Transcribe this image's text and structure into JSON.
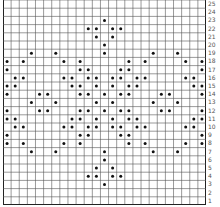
{
  "chart_data": {
    "type": "heatmap",
    "title": "",
    "columns": 25,
    "rows": 25,
    "row_labels": [
      "1",
      "2",
      "3",
      "4",
      "5",
      "6",
      "7",
      "8",
      "9",
      "10",
      "11",
      "12",
      "13",
      "14",
      "15",
      "16",
      "17",
      "18",
      "19",
      "20",
      "21",
      "22",
      "23",
      "24",
      "25"
    ],
    "row_label_position": "right",
    "marked_cells_by_row": {
      "25": [],
      "24": [],
      "23": [
        13
      ],
      "22": [
        11,
        12,
        14,
        15
      ],
      "21": [
        12,
        14
      ],
      "20": [
        13
      ],
      "19": [
        4,
        7,
        13,
        19,
        22
      ],
      "18": [
        1,
        3,
        8,
        10,
        16,
        18,
        23,
        25
      ],
      "17": [
        1,
        10,
        11,
        15,
        16,
        25
      ],
      "16": [
        2,
        3,
        8,
        9,
        11,
        12,
        14,
        15,
        17,
        18,
        23,
        24
      ],
      "15": [
        1,
        2,
        9,
        10,
        12,
        14,
        16,
        17,
        24,
        25
      ],
      "14": [
        1,
        5,
        6,
        10,
        11,
        13,
        15,
        16,
        20,
        21,
        25
      ],
      "13": [
        4,
        7,
        12,
        14,
        19,
        22
      ],
      "12": [
        1,
        5,
        6,
        10,
        11,
        13,
        15,
        16,
        20,
        21,
        25
      ],
      "11": [
        1,
        2,
        9,
        10,
        12,
        14,
        16,
        17,
        24,
        25
      ],
      "10": [
        2,
        3,
        8,
        9,
        11,
        12,
        14,
        15,
        17,
        18,
        23,
        24
      ],
      "9": [
        1,
        10,
        11,
        15,
        16,
        25
      ],
      "8": [
        1,
        3,
        8,
        10,
        16,
        18,
        23,
        25
      ],
      "7": [
        4,
        7,
        13,
        19,
        22
      ],
      "6": [
        13
      ],
      "5": [
        12,
        14
      ],
      "4": [
        11,
        12,
        14,
        15
      ],
      "3": [
        13
      ],
      "2": [],
      "1": []
    },
    "colors": {
      "grid": "#555555",
      "border": "#222222",
      "dot": "#111111",
      "background": "#ffffff"
    }
  }
}
